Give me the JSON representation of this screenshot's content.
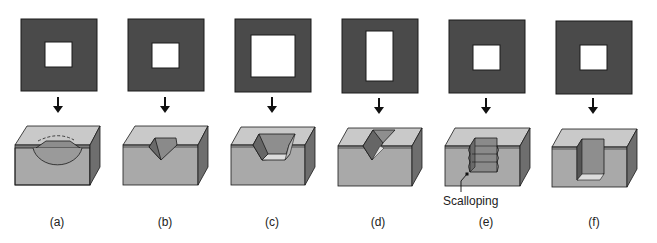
{
  "figure": {
    "panels": [
      {
        "id": "a",
        "label": "(a)",
        "mask_hole": "square",
        "etch_profile": "isotropic-hemispherical-undercut"
      },
      {
        "id": "b",
        "label": "(b)",
        "mask_hole": "square-small",
        "etch_profile": "anisotropic-pyramidal-pit"
      },
      {
        "id": "c",
        "label": "(c)",
        "mask_hole": "square-large",
        "etch_profile": "anisotropic-truncated-pyramid"
      },
      {
        "id": "d",
        "label": "(d)",
        "mask_hole": "rectangle",
        "etch_profile": "anisotropic-v-groove"
      },
      {
        "id": "e",
        "label": "(e)",
        "mask_hole": "square",
        "etch_profile": "deep-reactive-ion-scalloped"
      },
      {
        "id": "f",
        "label": "(f)",
        "mask_hole": "square",
        "etch_profile": "vertical-wall-trench"
      }
    ],
    "callouts": [
      {
        "panel": "e",
        "text": "Scalloping"
      }
    ],
    "colors": {
      "mask": "#4a4a4a",
      "hole": "#ffffff",
      "top_face": "#c9c9c9",
      "front_face": "#a9a9a9",
      "side_face": "#6e6e6e",
      "mask_layer": "#7d7d7d",
      "outline": "#1a1a1a"
    }
  }
}
